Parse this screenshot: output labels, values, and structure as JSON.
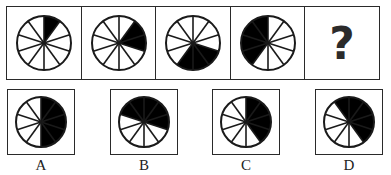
{
  "puzzle": {
    "sectors_per_wheel": 10,
    "fill_color": "#000000",
    "line_color": "#1a1a1a",
    "sequence": [
      {
        "id": "fig1",
        "shaded_from_deg": 0,
        "shaded_to_deg": 36,
        "shaded_count": 1
      },
      {
        "id": "fig2",
        "shaded_from_deg": 36,
        "shaded_to_deg": 108,
        "shaded_count": 2
      },
      {
        "id": "fig3",
        "shaded_from_deg": 108,
        "shaded_to_deg": 216,
        "shaded_count": 3
      },
      {
        "id": "fig4",
        "shaded_from_deg": 216,
        "shaded_to_deg": 360,
        "shaded_count": 4
      },
      {
        "id": "fig5",
        "unknown": true,
        "symbol": "?"
      }
    ],
    "options": [
      {
        "label": "A",
        "shaded_from_deg": 0,
        "shaded_to_deg": 180,
        "shaded_count": 5
      },
      {
        "label": "B",
        "shaded_from_deg": 288,
        "shaded_to_deg": 468,
        "shaded_count": 5
      },
      {
        "label": "C",
        "shaded_from_deg": 0,
        "shaded_to_deg": 144,
        "shaded_count": 4
      },
      {
        "label": "D",
        "shaded_from_deg": 324,
        "shaded_to_deg": 504,
        "shaded_count": 5
      }
    ]
  }
}
